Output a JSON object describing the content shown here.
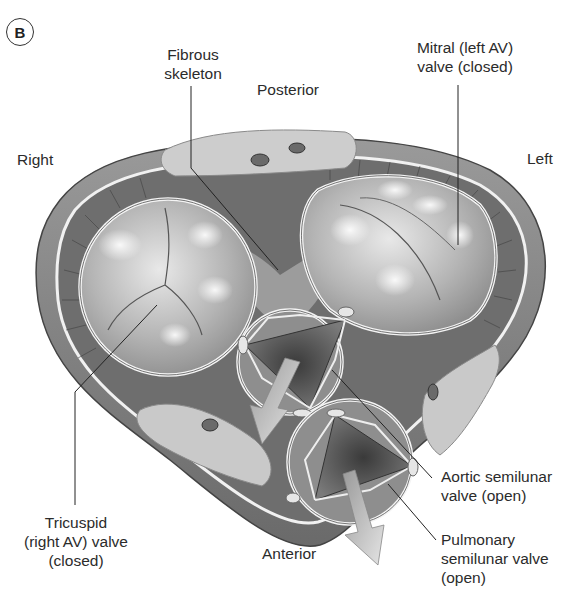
{
  "figure": {
    "panel_label": "B",
    "orientation_labels": {
      "posterior": "Posterior",
      "anterior": "Anterior",
      "right": "Right",
      "left": "Left"
    },
    "structure_labels": {
      "fibrous_skeleton": [
        "Fibrous",
        "skeleton"
      ],
      "mitral": [
        "Mitral (left AV)",
        "valve (closed)"
      ],
      "tricuspid": [
        "Tricuspid",
        "(right AV) valve",
        "(closed)"
      ],
      "aortic": [
        "Aortic semilunar",
        "valve (open)"
      ],
      "pulmonary": [
        "Pulmonary",
        "semilunar valve",
        "(open)"
      ]
    },
    "colors": {
      "background": "#ffffff",
      "outer_wall": "#8a8a8a",
      "wall_dark": "#5a5a5a",
      "valve_fill": "#b9b9b9",
      "valve_highlight": "#eeeeee",
      "fat_tissue": "#cfcfcf",
      "leader_line": "#222222",
      "text": "#2b2b2b"
    }
  }
}
